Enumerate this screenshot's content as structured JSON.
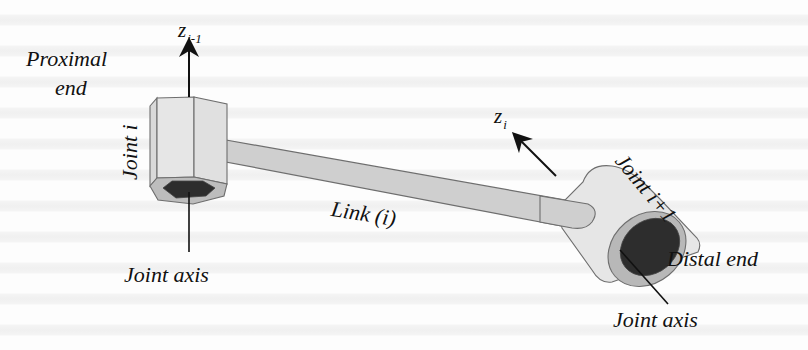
{
  "figure": {
    "type": "robot link with two joints (isometric sketch)",
    "labels": {
      "proximal_end_line1": "Proximal",
      "proximal_end_line2": "end",
      "z_prev_base": "z",
      "z_prev_sub": "i-1",
      "joint_i": "Joint i",
      "joint_axis_left": "Joint axis",
      "link": "Link (i)",
      "z_curr_base": "z",
      "z_curr_sub": "i",
      "joint_i_plus_1": "Joint i+1",
      "distal_end": "Distal end",
      "joint_axis_right": "Joint axis"
    },
    "colors": {
      "background": "#fdfdfd",
      "body_light": "#e3e3e3",
      "body_mid": "#d2d2d2",
      "link_fill": "#cfcfcf",
      "outline": "#6e6e6e",
      "bore_dark": "#2d2d2d",
      "ring": "#b8b8b8",
      "arrow": "#111111",
      "text": "#111111"
    }
  }
}
